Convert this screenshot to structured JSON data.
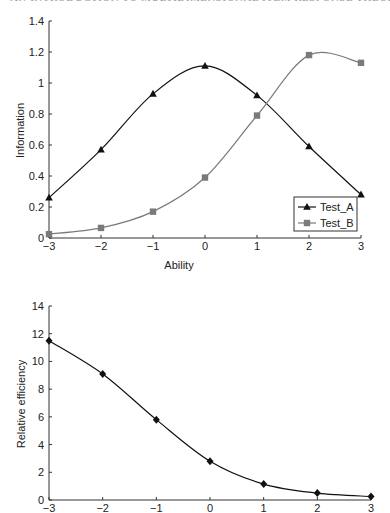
{
  "page_header": "AN INTRODUCTION TO MULTIDIMENSIONAL ITEM RESPONSE THEORY",
  "chart_data": [
    {
      "type": "line",
      "title": "",
      "xlabel": "Ability",
      "ylabel": "Information",
      "x": [
        -3,
        -2,
        -1,
        0,
        1,
        2,
        3
      ],
      "xlim": [
        -3,
        3
      ],
      "ylim": [
        0,
        1.4
      ],
      "xticks": [
        "−3",
        "−2",
        "−1",
        "0",
        "1",
        "2",
        "3"
      ],
      "yticks": [
        "0",
        "0.2",
        "0.4",
        "0.6",
        "0.8",
        "1",
        "1.2",
        "1.4"
      ],
      "grid": false,
      "legend_position": "lower right",
      "series": [
        {
          "name": "Test_A",
          "marker": "triangle",
          "color": "#111111",
          "values": [
            0.26,
            0.57,
            0.93,
            1.11,
            0.92,
            0.59,
            0.28
          ]
        },
        {
          "name": "Test_B",
          "marker": "square",
          "color": "#7a7a7a",
          "values": [
            0.025,
            0.065,
            0.17,
            0.39,
            0.79,
            1.18,
            1.13
          ]
        }
      ]
    },
    {
      "type": "line",
      "title": "",
      "xlabel": "",
      "ylabel": "Relative efficiency",
      "x": [
        -3,
        -2,
        -1,
        0,
        1,
        2,
        3
      ],
      "xlim": [
        -3,
        3
      ],
      "ylim": [
        0,
        14
      ],
      "xticks": [
        "−3",
        "−2",
        "−1",
        "0",
        "1",
        "2",
        "3"
      ],
      "yticks": [
        "0",
        "2",
        "4",
        "6",
        "8",
        "10",
        "12",
        "14"
      ],
      "grid": false,
      "series": [
        {
          "name": "Relative efficiency",
          "marker": "diamond",
          "color": "#111111",
          "values": [
            11.5,
            9.1,
            5.8,
            2.8,
            1.15,
            0.5,
            0.25
          ]
        }
      ]
    }
  ],
  "layout": {
    "charts": [
      {
        "x0": 49,
        "x1": 361,
        "y0": 238,
        "y1": 21
      },
      {
        "x0": 49,
        "x1": 371,
        "y0": 500,
        "y1": 306
      }
    ]
  }
}
